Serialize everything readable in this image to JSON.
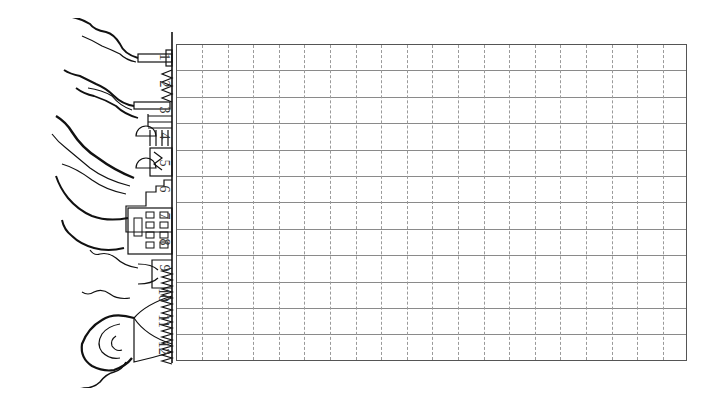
{
  "page": {
    "type": "grid worksheet (rotated landscape)",
    "illustration": "factory-smokestacks-pollution-sketch"
  },
  "grid": {
    "rows": 12,
    "columns": 20,
    "row_labels": [
      "1",
      "2",
      "3",
      "4",
      "5",
      "6",
      "7",
      "8",
      "9",
      "10",
      "11",
      "12"
    ],
    "colors": {
      "border": "#555555",
      "row_line": "#8a8a8a",
      "column_line": "#9a9a9a"
    },
    "column_line_style": "dashed",
    "row_line_style": "solid"
  }
}
